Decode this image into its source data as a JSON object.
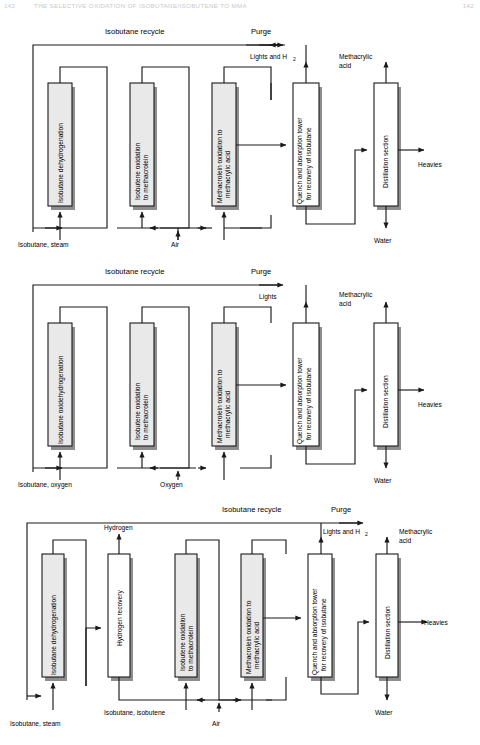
{
  "running_head": {
    "folio": "142",
    "title": "THE SELECTIVE OXIDATION OF ISOBUTANE/ISOBUTENE TO MMA",
    "page": "142"
  },
  "figure": {
    "type": "process-flow-diagram",
    "colors": {
      "reactor_block_fill": "#e9e9e9",
      "plain_block_fill": "#ffffff",
      "line": "#1a1a1a",
      "shadow": "#8e8e8e",
      "background": "#ffffff"
    },
    "diagrams": [
      {
        "id": "route-1",
        "recycle_label": "Isobutane recycle",
        "purge_label": "Purge",
        "blocks": [
          {
            "name": "isobutane-dehydrogenation",
            "label": "Isobutane dehydrogenation",
            "shaded": true
          },
          {
            "name": "isobutene-oxidation-to-methacrolein",
            "label": "Isobutene oxidation\nto methacrolein",
            "label_line1": "Isobutene oxidation",
            "label_line2": "to methacrolein",
            "shaded": true
          },
          {
            "name": "methacrolein-oxidation-to-methacrylic-acid",
            "label_line1": "Methacrolein oxidation to",
            "label_line2": "methacrylic acid",
            "shaded": true
          },
          {
            "name": "quench-and-absorption-tower",
            "label_line1": "Quench and absorption tower",
            "label_line2": "for recovery of isobutane",
            "shaded": false
          },
          {
            "name": "distillation-section",
            "label_line1": "Distillation section",
            "label_line2": "",
            "shaded": false
          }
        ],
        "feeds": [
          {
            "name": "feed-isobutane-steam",
            "label": "Isobutane, steam"
          },
          {
            "name": "feed-air",
            "label": "Air"
          }
        ],
        "outputs": [
          {
            "name": "output-lights-and-h2",
            "label": "Lights and H",
            "subscript": "2"
          },
          {
            "name": "output-methacrylic-acid",
            "label_line1": "Methacrylic",
            "label_line2": "acid"
          },
          {
            "name": "output-heavies",
            "label": "Heavies"
          },
          {
            "name": "output-water",
            "label": "Water"
          }
        ]
      },
      {
        "id": "route-2",
        "recycle_label": "Isobutane recycle",
        "purge_label": "Purge",
        "blocks": [
          {
            "name": "isobutane-oxidehydrogenation",
            "label": "Isobutane oxidehydrogenation",
            "shaded": true
          },
          {
            "name": "isobutene-oxidation-to-methacrolein",
            "label_line1": "Isobutene oxidation",
            "label_line2": "to methacrolein",
            "shaded": true
          },
          {
            "name": "methacrolein-oxidation-to-methacrylic-acid",
            "label_line1": "Methacrolein oxidation to",
            "label_line2": "methacrylic acid",
            "shaded": true
          },
          {
            "name": "quench-and-absorption-tower",
            "label_line1": "Quench and absorption tower",
            "label_line2": "for recovery of isobutane",
            "shaded": false
          },
          {
            "name": "distillation-section",
            "label_line1": "Distillation section",
            "label_line2": "",
            "shaded": false
          }
        ],
        "feeds": [
          {
            "name": "feed-isobutane-oxygen",
            "label": "Isobutane, oxygen"
          },
          {
            "name": "feed-oxygen",
            "label": "Oxygen"
          }
        ],
        "outputs": [
          {
            "name": "output-lights",
            "label": "Lights"
          },
          {
            "name": "output-methacrylic-acid",
            "label_line1": "Methacrylic",
            "label_line2": "acid"
          },
          {
            "name": "output-heavies",
            "label": "Heavies"
          },
          {
            "name": "output-water",
            "label": "Water"
          }
        ]
      },
      {
        "id": "route-3",
        "recycle_label": "Isobutane recycle",
        "purge_label": "Purge",
        "blocks": [
          {
            "name": "isobutane-dehydrogenation",
            "label": "Isobutane dehydrogenation",
            "shaded": true
          },
          {
            "name": "hydrogen-recovery",
            "label": "Hydrogen recovery",
            "shaded": false
          },
          {
            "name": "isobutene-oxidation-to-methacrolein",
            "label_line1": "Isobutene oxidation",
            "label_line2": "to methacrolein",
            "shaded": true
          },
          {
            "name": "methacrolein-oxidation-to-methacrylic-acid",
            "label_line1": "Methacrolein oxidation to",
            "label_line2": "methacrylic acid",
            "shaded": true
          },
          {
            "name": "quench-and-absorption-tower",
            "label_line1": "Quench and absorption tower",
            "label_line2": "for recovery of isobutane",
            "shaded": false
          },
          {
            "name": "distillation-section",
            "label_line1": "Distillation section",
            "label_line2": "",
            "shaded": false
          }
        ],
        "feeds": [
          {
            "name": "feed-isobutane-steam",
            "label": "Isobutane, steam"
          },
          {
            "name": "feed-isobutane-isobutene",
            "label": "Isobutane, isobutene"
          },
          {
            "name": "feed-air",
            "label": "Air"
          }
        ],
        "outputs": [
          {
            "name": "output-hydrogen",
            "label": "Hydrogen"
          },
          {
            "name": "output-lights-and-h2",
            "label": "Lights and H",
            "subscript": "2"
          },
          {
            "name": "output-methacrylic-acid",
            "label_line1": "Methacrylic",
            "label_line2": "acid"
          },
          {
            "name": "output-heavies",
            "label": "Heavies"
          },
          {
            "name": "output-water",
            "label": "Water"
          }
        ]
      }
    ]
  }
}
